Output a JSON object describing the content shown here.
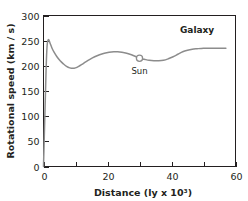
{
  "chart_data": {
    "type": "line",
    "title": "",
    "subtitle": "",
    "xlabel": "Distance (ly x 10³)",
    "ylabel": "Rotational speed (km / s)",
    "xlim": [
      0,
      60
    ],
    "ylim": [
      0,
      300
    ],
    "grid": false,
    "legend_position": "none",
    "xticks": [
      0,
      10,
      20,
      30,
      40,
      50,
      60
    ],
    "xticklabels": [
      "0",
      "",
      "20",
      "",
      "40",
      "",
      "60"
    ],
    "xticklabels_major": [
      "0",
      "20",
      "40",
      "60"
    ],
    "yticks": [
      0,
      50,
      100,
      150,
      200,
      250,
      300
    ],
    "yticklabels": [
      "0",
      "50",
      "100",
      "150",
      "200",
      "250",
      "300"
    ],
    "series": [
      {
        "name": "Galaxy rotation curve",
        "color": "#8c8c8c",
        "x": [
          0.0,
          0.4,
          0.8,
          1.1,
          1.5,
          2.0,
          2.6,
          3.3,
          4.2,
          5.2,
          6.2,
          7.2,
          8.2,
          9.2,
          10.0,
          11.0,
          12.0,
          13.2,
          14.5,
          16.0,
          17.5,
          19.0,
          20.5,
          22.0,
          23.2,
          24.5,
          26.0,
          27.5,
          29.0,
          30.0,
          31.5,
          33.0,
          34.5,
          36.0,
          37.5,
          39.0,
          40.5,
          42.0,
          43.5,
          45.0,
          46.5,
          48.0,
          50.0,
          52.0,
          54.0,
          56.0,
          57.0
        ],
        "y": [
          0,
          95,
          190,
          238,
          252,
          246,
          236,
          227,
          218,
          210,
          204,
          199,
          196,
          195,
          196,
          199,
          203,
          208,
          213,
          218,
          222,
          225,
          227,
          228,
          228,
          227,
          225,
          222,
          218,
          215,
          213,
          211,
          210,
          210,
          211,
          214,
          218,
          223,
          228,
          231,
          233,
          234,
          235,
          235,
          235,
          235,
          235
        ]
      }
    ],
    "annotations": [
      {
        "name": "sun-marker",
        "label": "Sun",
        "x": 30,
        "y": 215,
        "marker": "open-circle",
        "label_offset_y": -18
      },
      {
        "name": "galaxy-label",
        "label": "Galaxy",
        "x": 48,
        "y": 266,
        "bold": true
      }
    ]
  }
}
